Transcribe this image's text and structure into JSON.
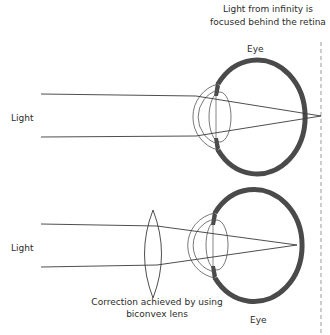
{
  "title": {
    "line1": "Light from infinity is",
    "line2": "focused behind the retina"
  },
  "top_panel": {
    "light_label": "Light",
    "eye_label": "Eye"
  },
  "bottom_panel": {
    "light_label": "Light",
    "eye_label": "Eye",
    "lens_caption_line1": "Correction achieved by using",
    "lens_caption_line2": "biconvex lens"
  },
  "colors": {
    "line": "#3a3a3a",
    "sclera": "#4a4a4a",
    "dashed_line": "#9a9a9a",
    "text": "#2b2b2b"
  }
}
